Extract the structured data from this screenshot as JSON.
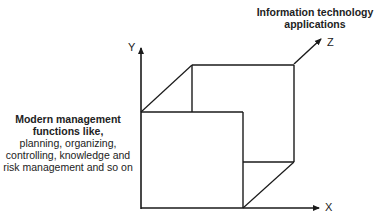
{
  "diagram": {
    "type": "3d-axes-cube",
    "axes": {
      "x": {
        "label": "X"
      },
      "y": {
        "label": "Y"
      },
      "z": {
        "label": "Z"
      }
    },
    "left_label": {
      "bold_lines": [
        "Modern management",
        "functions like,"
      ],
      "normal_lines": [
        "planning, organizing,",
        "controlling, knowledge and",
        "risk management and so on"
      ]
    },
    "top_label": {
      "bold_lines": [
        "Information technology",
        "applications"
      ]
    },
    "colors": {
      "line": "#1a1a1a",
      "background": "#ffffff"
    }
  }
}
